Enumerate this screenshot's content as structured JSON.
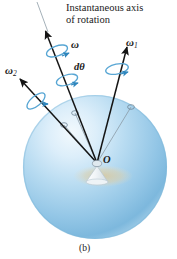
{
  "figure": {
    "caption": "(b)",
    "title_line1": "Instantaneous axis",
    "title_line2": "of rotation",
    "background": "#ffffff"
  },
  "labels": {
    "omega": "ω",
    "omega1_base": "ω",
    "omega1_sub": "1",
    "omega2_base": "ω",
    "omega2_sub": "2",
    "dtheta": "dθ",
    "origin": "O"
  },
  "colors": {
    "sphere_light": "#eaf4fb",
    "sphere_mid": "#a8d0ea",
    "sphere_dark": "#7ab6dd",
    "sphere_edge": "#6aa9d4",
    "vector": "#1a1a1a",
    "thin_line": "#8a9aa6",
    "spin_arrow": "#4f9fd0",
    "spin_arrow_dark": "#2a7fb8",
    "shadow": "#d8c9a0",
    "cone": "#e8eef2",
    "text": "#1a1a1a"
  },
  "geometry": {
    "sphere": {
      "cx": 95,
      "cy": 167,
      "r": 72
    },
    "origin_point": {
      "x": 97,
      "y": 163
    },
    "vectors": [
      {
        "name": "omega",
        "tip_x": 43,
        "tip_y": 28,
        "surface_x": 75,
        "surface_y": 113,
        "tail_x": 97,
        "tail_y": 163
      },
      {
        "name": "omega1",
        "tip_x": 126,
        "tip_y": 44,
        "surface_x": 131,
        "surface_y": 107,
        "tail_x": 97,
        "tail_y": 163
      },
      {
        "name": "omega2",
        "tip_x": 18,
        "tip_y": 78,
        "surface_x": 64,
        "surface_y": 125,
        "tail_x": 97,
        "tail_y": 163
      }
    ],
    "dashed_axis": {
      "x1": 37,
      "y1": 2,
      "x2": 47,
      "y2": 30
    },
    "spin_rings": [
      {
        "for": "omega",
        "cx": 57,
        "cy": 50
      },
      {
        "for": "omega1",
        "cx": 116,
        "cy": 68
      },
      {
        "for": "omega2",
        "cx": 35,
        "cy": 100
      },
      {
        "for": "dtheta",
        "cx": 68,
        "cy": 79
      }
    ]
  }
}
